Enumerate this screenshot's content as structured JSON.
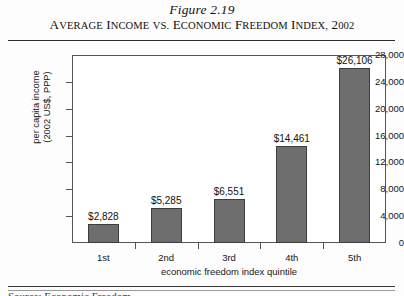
{
  "figure": {
    "number": "Figure 2.19",
    "title_words": [
      "Average",
      "Income",
      "vs.",
      "Economic",
      "Freedom",
      "Index,",
      "2002"
    ],
    "title_full": "Average Income vs. Economic Freedom Index, 2002",
    "footnote_partial": "Source: Economic Freedom"
  },
  "chart_data": {
    "type": "bar",
    "title": "Average Income vs. Economic Freedom Index, 2002",
    "categories": [
      "1st",
      "2nd",
      "3rd",
      "4th",
      "5th"
    ],
    "values": [
      2828,
      5285,
      6551,
      14461,
      26106
    ],
    "value_labels": [
      "$2,828",
      "$5,285",
      "$6,551",
      "$14,461",
      "$26,106"
    ],
    "xlabel": "economic freedom index quintile",
    "ylabel": "per capita income (2002 US$, PPP)",
    "ylabel_line1": "per capita income",
    "ylabel_line2": "(2002 US$, PPP)",
    "ylim": [
      0,
      28000
    ],
    "ytick_values": [
      28000,
      24000,
      20000,
      16000,
      12000,
      8000,
      4000,
      0
    ],
    "ytick_labels": [
      "28,000",
      "24,000",
      "20,000",
      "16,000",
      "12,000",
      "8,000",
      "4,000",
      "0"
    ],
    "grid": false,
    "legend": null,
    "bar_color": "#6e6e6e",
    "bar_edge_color": "#3d3d3d",
    "plot_border_color": "#555555",
    "background": "#ffffff"
  }
}
